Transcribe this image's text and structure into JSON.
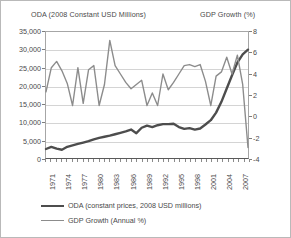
{
  "chart_data": {
    "type": "line",
    "title": "",
    "xlabel": "",
    "y_left_label": "ODA (2008 Constant USD Millions)",
    "y_right_label": "GDP Growth (%)",
    "ylim_left": [
      0,
      35000
    ],
    "ylim_right": [
      -4,
      8
    ],
    "y_left_ticks": [
      "0",
      "5,000",
      "10,000",
      "15,000",
      "20,000",
      "25,000",
      "30,000",
      "35,000"
    ],
    "y_left_tick_values": [
      0,
      5000,
      10000,
      15000,
      20000,
      25000,
      30000,
      35000
    ],
    "y_right_ticks": [
      "-4",
      "-2",
      "0",
      "2",
      "4",
      "6",
      "8"
    ],
    "y_right_tick_values": [
      -4,
      -2,
      0,
      2,
      4,
      6,
      8
    ],
    "grid": true,
    "legend_position": "bottom-left",
    "x": [
      1971,
      1972,
      1973,
      1974,
      1975,
      1976,
      1977,
      1978,
      1979,
      1980,
      1981,
      1982,
      1983,
      1984,
      1985,
      1986,
      1987,
      1988,
      1989,
      1990,
      1991,
      1992,
      1993,
      1994,
      1995,
      1996,
      1997,
      1998,
      1999,
      2000,
      2001,
      2002,
      2003,
      2004,
      2005,
      2006,
      2007,
      2008,
      2009
    ],
    "x_tick_labels": [
      "1971",
      "1974",
      "1977",
      "1980",
      "1983",
      "1986",
      "1989",
      "1992",
      "1995",
      "1998",
      "2001",
      "2004",
      "2007"
    ],
    "x_tick_label_values": [
      1971,
      1974,
      1977,
      1980,
      1983,
      1986,
      1989,
      1992,
      1995,
      1998,
      2001,
      2004,
      2007
    ],
    "series": [
      {
        "name": "ODA (constant prices, 2008 USD millions)",
        "axis": "left",
        "color": "#4d4d4d",
        "width": 2.4,
        "values": [
          2500,
          3100,
          2600,
          2300,
          3100,
          3500,
          3900,
          4300,
          4700,
          5200,
          5600,
          5900,
          6200,
          6600,
          7000,
          7400,
          7900,
          6900,
          8400,
          9000,
          8600,
          9100,
          9400,
          9400,
          9500,
          8600,
          8100,
          8300,
          7900,
          8200,
          9300,
          10500,
          12600,
          15600,
          19300,
          23000,
          26500,
          28800,
          30100
        ]
      },
      {
        "name": "GDP Growth (Annual %)",
        "axis": "right",
        "color": "#8c8c8c",
        "width": 1.4,
        "values": [
          2.3,
          4.6,
          5.2,
          4.3,
          3.1,
          1.0,
          4.6,
          1.2,
          4.4,
          4.8,
          1.0,
          3.0,
          7.2,
          4.8,
          4.0,
          3.2,
          2.6,
          3.0,
          3.4,
          1.0,
          2.2,
          1.0,
          4.0,
          2.5,
          3.2,
          4.0,
          4.8,
          4.9,
          4.7,
          4.9,
          3.3,
          1.0,
          3.8,
          4.2,
          5.6,
          4.0,
          5.8,
          3.0,
          -3.0
        ]
      }
    ],
    "legend": [
      {
        "label": "ODA (constant prices, 2008 USD millions)",
        "swatch": "oda"
      },
      {
        "label": "GDP Growth (Annual %)",
        "swatch": "gdp"
      }
    ]
  }
}
